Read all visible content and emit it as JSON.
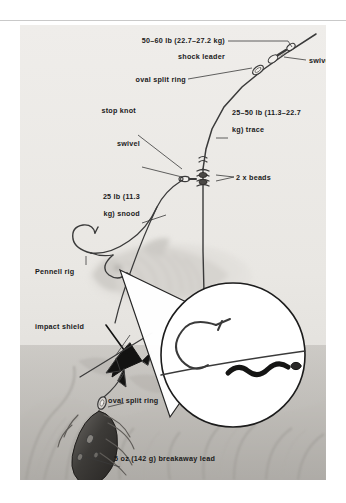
{
  "figure": {
    "background_color": "#eceae6",
    "page_color": "#ffffff",
    "line_color": "#3a3a3a",
    "text_color": "#1a1a1a"
  },
  "labels": {
    "shock_leader_spec": "50–60 lb (22.7–27.2 kg)",
    "shock_leader": "shock leader",
    "swivel_top": "swivel",
    "oval_split_ring_top": "oval split ring",
    "stop_knot": "stop knot",
    "trace_spec": "25–50 lb (11.3–22.7",
    "trace_spec_2": "kg) trace",
    "swivel_mid": "swivel",
    "beads": "2 x beads",
    "snood_spec": "25 lb (11.3",
    "snood_spec_2": "kg) snood",
    "pennell_rig": "Pennell rig",
    "impact_shield": "impact shield",
    "oval_split_ring_bottom": "oval split ring",
    "breakaway_lead": "5 oz (142 g) breakaway lead"
  },
  "components": [
    {
      "name": "swivel-top",
      "label": "swivel"
    },
    {
      "name": "oval-split-ring-top",
      "label": "oval split ring"
    },
    {
      "name": "shock-leader",
      "label": "shock leader",
      "spec": "50–60 lb (22.7–27.2 kg)"
    },
    {
      "name": "trace",
      "label": "trace",
      "spec": "25–50 lb (11.3–22.7 kg)"
    },
    {
      "name": "stop-knot",
      "label": "stop knot"
    },
    {
      "name": "swivel-mid",
      "label": "swivel"
    },
    {
      "name": "beads",
      "label": "2 x beads",
      "count": 2
    },
    {
      "name": "snood",
      "label": "snood",
      "spec": "25 lb (11.3 kg)"
    },
    {
      "name": "pennell-rig",
      "label": "Pennell rig"
    },
    {
      "name": "impact-shield",
      "label": "impact shield"
    },
    {
      "name": "oval-split-ring-bottom",
      "label": "oval split ring"
    },
    {
      "name": "breakaway-lead",
      "label": "breakaway lead",
      "spec": "5 oz (142 g)"
    }
  ],
  "inset": {
    "name": "magnified-hook-detail",
    "shape": "circle",
    "contents": "hook whipped to snood with bait elastic"
  }
}
